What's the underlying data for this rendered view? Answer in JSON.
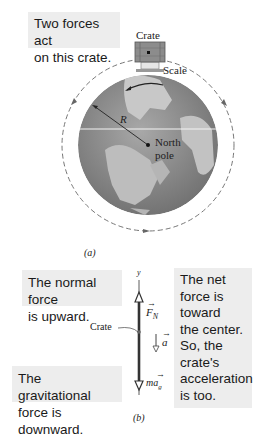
{
  "panel_a": {
    "callout": "Two forces act on this crate.",
    "callout_lines": [
      "Two forces act",
      "on this crate."
    ],
    "crate_label": "Crate",
    "scale_label": "Scale",
    "radius_label": "R",
    "pole_label_line1": "North",
    "pole_label_line2": "pole",
    "caption": "(a)"
  },
  "panel_b": {
    "callout_normal": [
      "The normal force",
      "is upward."
    ],
    "callout_gravity": [
      "The gravitational",
      "force is downward."
    ],
    "callout_net": [
      "The net",
      "force is",
      "toward",
      "the center.",
      "So, the",
      "crate's",
      "acceleration",
      "is too."
    ],
    "axis_label": "y",
    "crate_label": "Crate",
    "normal_force_label": "F",
    "normal_force_sub": "N",
    "accel_label": "a",
    "gravity_label": "ma",
    "gravity_sub": "g",
    "caption": "(b)"
  },
  "colors": {
    "callout_bg": "#ededed",
    "globe_dark": "#7d7d7d",
    "globe_light": "#c4c4c4",
    "crate": "#8a8a8a",
    "line": "#333333"
  }
}
